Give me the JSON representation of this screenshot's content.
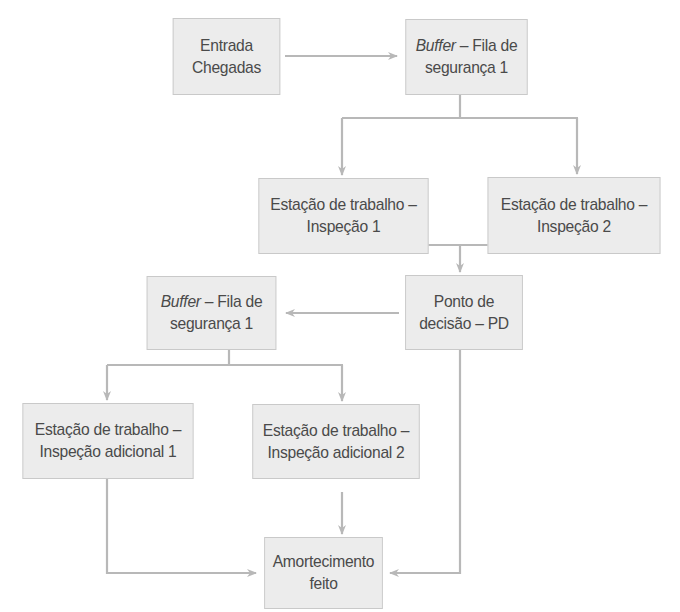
{
  "diagram": {
    "type": "flowchart",
    "colors": {
      "box_fill": "#ececec",
      "box_border": "#c9c9c9",
      "text": "#4a4a4a",
      "connector": "#b8b8b8"
    },
    "nodes": [
      {
        "id": "entrada",
        "line1": "Entrada",
        "line2": "Chegadas"
      },
      {
        "id": "buffer1",
        "line1_italic": "Buffer",
        "line1_rest": " – Fila de",
        "line2": "segurança 1"
      },
      {
        "id": "insp1",
        "line1": "Estação de trabalho –",
        "line2": "Inspeção 1"
      },
      {
        "id": "insp2",
        "line1": "Estação de trabalho –",
        "line2": "Inspeção 2"
      },
      {
        "id": "pd",
        "line1": "Ponto de",
        "line2": "decisão – PD"
      },
      {
        "id": "buffer2",
        "line1_italic": "Buffer",
        "line1_rest": " – Fila de",
        "line2": "segurança 1"
      },
      {
        "id": "adic1",
        "line1": "Estação de trabalho –",
        "line2": "Inspeção adicional 1"
      },
      {
        "id": "adic2",
        "line1": "Estação de trabalho –",
        "line2": "Inspeção adicional 2"
      },
      {
        "id": "amort",
        "line1": "Amortecimento",
        "line2": "feito"
      }
    ],
    "edges": [
      [
        "entrada",
        "buffer1"
      ],
      [
        "buffer1",
        "insp1"
      ],
      [
        "buffer1",
        "insp2"
      ],
      [
        "insp1",
        "pd"
      ],
      [
        "insp2",
        "pd"
      ],
      [
        "pd",
        "buffer2"
      ],
      [
        "pd",
        "amort"
      ],
      [
        "buffer2",
        "adic1"
      ],
      [
        "buffer2",
        "adic2"
      ],
      [
        "adic1",
        "amort"
      ],
      [
        "adic2",
        "amort"
      ]
    ]
  }
}
